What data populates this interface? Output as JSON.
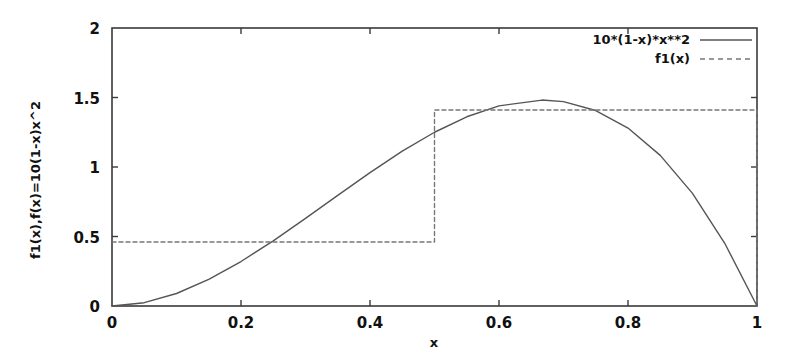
{
  "chart_data": {
    "type": "line",
    "title": "",
    "xlabel": "x",
    "ylabel": "f1(x),f(x)=10(1-x)x^2",
    "xlim": [
      0,
      1
    ],
    "ylim": [
      0,
      2
    ],
    "grid": false,
    "legend_position": "top-right",
    "xticks": [
      "0",
      "0.2",
      "0.4",
      "0.6",
      "0.8",
      "1"
    ],
    "xtick_values": [
      0,
      0.2,
      0.4,
      0.6,
      0.8,
      1
    ],
    "yticks": [
      "0",
      "0.5",
      "1",
      "1.5",
      "2"
    ],
    "ytick_values": [
      0,
      0.5,
      1,
      1.5,
      2
    ],
    "series": [
      {
        "name": "10*(1-x)*x**2",
        "style": "solid",
        "color": "#555555",
        "x": [
          0,
          0.05,
          0.1,
          0.15,
          0.2,
          0.25,
          0.3,
          0.35,
          0.4,
          0.45,
          0.5,
          0.55,
          0.6,
          0.6667,
          0.7,
          0.75,
          0.8,
          0.85,
          0.9,
          0.95,
          1
        ],
        "values": [
          0,
          0.0238,
          0.09,
          0.1913,
          0.32,
          0.4688,
          0.63,
          0.7963,
          0.96,
          1.1138,
          1.25,
          1.3613,
          1.44,
          1.4815,
          1.47,
          1.4063,
          1.28,
          1.0838,
          0.81,
          0.4513,
          0
        ]
      },
      {
        "name": "f1(x)",
        "style": "dashed",
        "color": "#777777",
        "x": [
          0,
          0.5,
          0.5,
          1,
          1
        ],
        "values": [
          0.46,
          0.46,
          1.41,
          1.41,
          0
        ]
      }
    ],
    "annotations": {
      "step_breakpoint": 0.5,
      "step_low_level": 0.46,
      "step_high_level": 1.41,
      "curve_peak_x": 0.6667,
      "curve_peak_y": 1.4815
    }
  },
  "legend": {
    "entries": [
      {
        "label": "10*(1-x)*x**2",
        "style": "solid"
      },
      {
        "label": "f1(x)",
        "style": "dashed"
      }
    ]
  }
}
